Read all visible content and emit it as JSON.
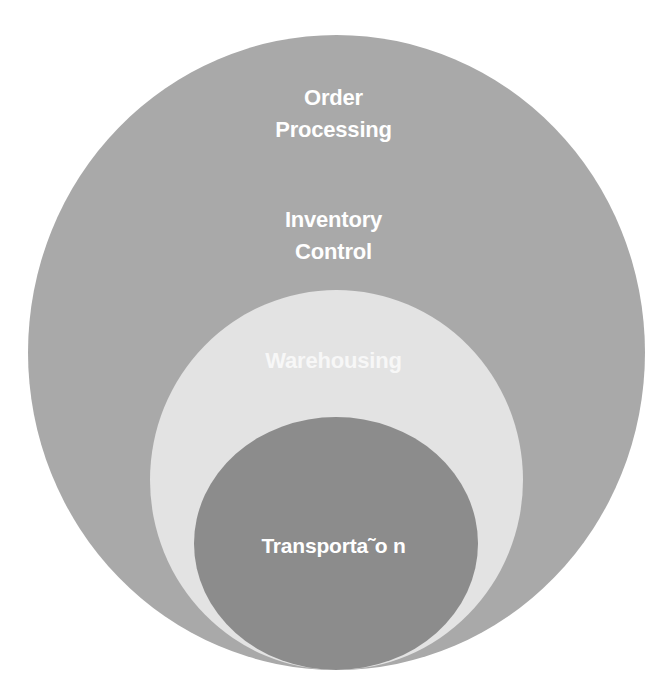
{
  "diagram": {
    "type": "nested-circles",
    "layers": [
      {
        "id": "order-processing",
        "lines": [
          "Order",
          "Processing"
        ],
        "color": "#a9a9a9"
      },
      {
        "id": "inventory-control",
        "lines": [
          "Inventory",
          "Control"
        ],
        "color": "#a9a9a9"
      },
      {
        "id": "warehousing",
        "lines": [
          "Warehousing"
        ],
        "color": "#e3e3e3"
      },
      {
        "id": "transportation",
        "lines": [
          "Transporta˜o n"
        ],
        "color": "#8c8c8c"
      }
    ],
    "background": "#ffffff",
    "text_color": "#ffffff"
  }
}
